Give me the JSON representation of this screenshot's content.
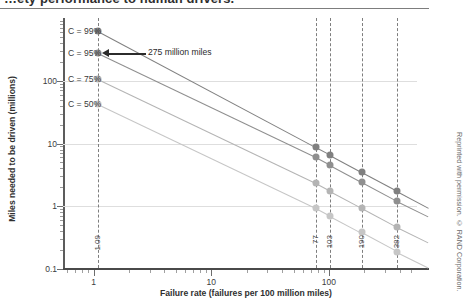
{
  "page": {
    "cut_heading": "…ety performance to human drivers.",
    "credit": "Reprinted with permission. © RAND Corporation."
  },
  "chart_data": {
    "type": "line",
    "title": "",
    "xlabel": "Failure rate (failures per 100 million miles)",
    "ylabel": "Miles needed to be driven (millions)",
    "xscale": "log",
    "yscale": "log",
    "xlim": [
      0.55,
      560
    ],
    "ylim": [
      0.1,
      1000
    ],
    "grid": true,
    "legend_position": "inline-left",
    "x_tick_labels": [
      "1",
      "10",
      "100"
    ],
    "x_tick_values": [
      1,
      10,
      100
    ],
    "y_tick_labels": [
      "100",
      "10",
      "1",
      "0.1"
    ],
    "y_tick_values": [
      100,
      10,
      1,
      0.1
    ],
    "reference_lines": [
      {
        "label": "1.09",
        "x": 1.09
      },
      {
        "label": "77",
        "x": 77
      },
      {
        "label": "103",
        "x": 103
      },
      {
        "label": "190",
        "x": 190
      },
      {
        "label": "382",
        "x": 382
      }
    ],
    "series": [
      {
        "name": "C = 99%",
        "color": "#808080",
        "points": [
          {
            "x": 1.09,
            "y": 620
          },
          {
            "x": 77,
            "y": 8.8
          },
          {
            "x": 103,
            "y": 6.6
          },
          {
            "x": 190,
            "y": 3.55
          },
          {
            "x": 382,
            "y": 1.77
          }
        ]
      },
      {
        "name": "C = 95%",
        "color": "#8f8f8f",
        "points": [
          {
            "x": 1.09,
            "y": 275
          },
          {
            "x": 77,
            "y": 6.1
          },
          {
            "x": 103,
            "y": 4.55
          },
          {
            "x": 190,
            "y": 2.46
          },
          {
            "x": 382,
            "y": 1.22
          }
        ]
      },
      {
        "name": "C = 75%",
        "color": "#b4b4b4",
        "points": [
          {
            "x": 1.09,
            "y": 106
          },
          {
            "x": 77,
            "y": 2.35
          },
          {
            "x": 103,
            "y": 1.75
          },
          {
            "x": 190,
            "y": 0.95
          },
          {
            "x": 382,
            "y": 0.47
          }
        ]
      },
      {
        "name": "C = 50%",
        "color": "#c6c6c6",
        "points": [
          {
            "x": 1.09,
            "y": 43
          },
          {
            "x": 77,
            "y": 0.95
          },
          {
            "x": 103,
            "y": 0.71
          },
          {
            "x": 190,
            "y": 0.385
          },
          {
            "x": 382,
            "y": 0.19
          }
        ]
      }
    ],
    "annotations": [
      {
        "text": "275 million miles",
        "target_x": 1.09,
        "target_y": 275
      }
    ]
  }
}
